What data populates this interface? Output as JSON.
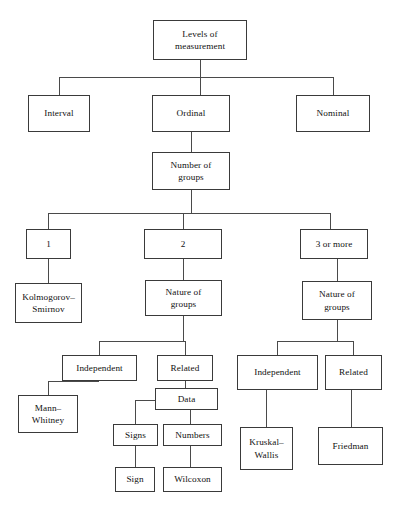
{
  "diagram": {
    "type": "flowchart",
    "title_node": "Levels of measurement",
    "orientation": "top-down",
    "canvas": {
      "width": 400,
      "height": 513
    },
    "style": {
      "box_border_color": "#3a3a3a",
      "box_fill_color": "#ffffff",
      "connector_color": "#4a4a4a",
      "text_color": "#111111",
      "background_color": "#ffffff"
    },
    "nodes": {
      "root": "Levels of\nmeasurement",
      "interval": "Interval",
      "ordinal": "Ordinal",
      "nominal": "Nominal",
      "number_of_groups": "Number of\ngroups",
      "groups_one": "1",
      "groups_two": "2",
      "groups_three_or_more": "3 or more",
      "kolmogorov_smirnov": "Kolmogorov–\nSmirnov",
      "nature_of_groups_two": "Nature of\ngroups",
      "nature_of_groups_three": "Nature of\ngroups",
      "independent_two": "Independent",
      "related_two": "Related",
      "mann_whitney": "Mann–\nWhitney",
      "data": "Data",
      "signs": "Signs",
      "numbers": "Numbers",
      "sign": "Sign",
      "wilcoxon": "Wilcoxon",
      "independent_three": "Independent",
      "related_three": "Related",
      "kruskal_wallis": "Kruskal–\nWallis",
      "friedman": "Friedman"
    },
    "edges": [
      {
        "from": "root",
        "to": "interval"
      },
      {
        "from": "root",
        "to": "ordinal"
      },
      {
        "from": "root",
        "to": "nominal"
      },
      {
        "from": "ordinal",
        "to": "number_of_groups"
      },
      {
        "from": "number_of_groups",
        "to": "groups_one"
      },
      {
        "from": "number_of_groups",
        "to": "groups_two"
      },
      {
        "from": "number_of_groups",
        "to": "groups_three_or_more"
      },
      {
        "from": "groups_one",
        "to": "kolmogorov_smirnov"
      },
      {
        "from": "groups_two",
        "to": "nature_of_groups_two"
      },
      {
        "from": "groups_three_or_more",
        "to": "nature_of_groups_three"
      },
      {
        "from": "nature_of_groups_two",
        "to": "independent_two"
      },
      {
        "from": "nature_of_groups_two",
        "to": "related_two"
      },
      {
        "from": "independent_two",
        "to": "mann_whitney"
      },
      {
        "from": "related_two",
        "to": "data"
      },
      {
        "from": "data",
        "to": "signs"
      },
      {
        "from": "data",
        "to": "numbers"
      },
      {
        "from": "signs",
        "to": "sign"
      },
      {
        "from": "numbers",
        "to": "wilcoxon"
      },
      {
        "from": "nature_of_groups_three",
        "to": "independent_three"
      },
      {
        "from": "nature_of_groups_three",
        "to": "related_three"
      },
      {
        "from": "independent_three",
        "to": "kruskal_wallis"
      },
      {
        "from": "related_three",
        "to": "friedman"
      }
    ]
  }
}
